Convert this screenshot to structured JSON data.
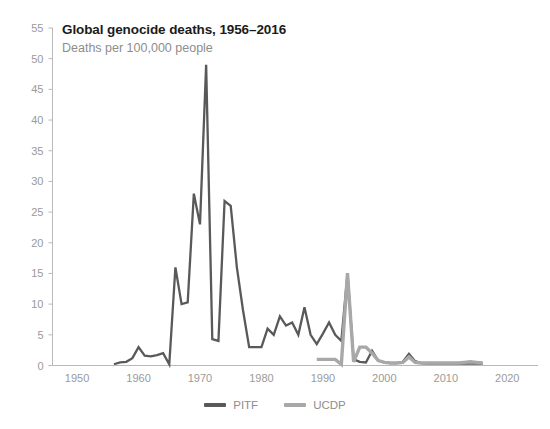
{
  "chart_data": {
    "type": "line",
    "title": "Global genocide deaths, 1956–2016",
    "subtitle": "Deaths per 100,000 people",
    "xlabel": "",
    "ylabel": "",
    "xlim": [
      1946,
      2025
    ],
    "ylim": [
      0,
      55
    ],
    "grid": false,
    "legend_position": "bottom-center",
    "xticks": [
      1950,
      1960,
      1970,
      1980,
      1990,
      2000,
      2010,
      2020
    ],
    "xtick_labels": [
      "1950",
      "1960",
      "1970",
      "1980",
      "1990",
      "2000",
      "2010",
      "2020"
    ],
    "yticks": [
      0,
      5,
      10,
      15,
      20,
      25,
      30,
      35,
      40,
      45,
      50,
      55
    ],
    "ytick_labels": [
      "0",
      "5",
      "10",
      "15",
      "20",
      "25",
      "30",
      "35",
      "40",
      "45",
      "50",
      "55"
    ],
    "colors": {
      "PITF": "#595959",
      "UCDP": "#a8a8a8"
    },
    "series": [
      {
        "name": "PITF",
        "color": "#595959",
        "x": [
          1956,
          1957,
          1958,
          1959,
          1960,
          1961,
          1962,
          1963,
          1964,
          1965,
          1966,
          1967,
          1968,
          1969,
          1970,
          1971,
          1972,
          1973,
          1974,
          1975,
          1976,
          1977,
          1978,
          1979,
          1980,
          1981,
          1982,
          1983,
          1984,
          1985,
          1986,
          1987,
          1988,
          1989,
          1990,
          1991,
          1992,
          1993,
          1994,
          1995,
          1996,
          1997,
          1998,
          1999,
          2000,
          2001,
          2002,
          2003,
          2004,
          2005,
          2006,
          2007,
          2008,
          2009,
          2010,
          2011,
          2012,
          2013,
          2014,
          2015,
          2016
        ],
        "values": [
          0.2,
          0.5,
          0.6,
          1.2,
          3.0,
          1.6,
          1.5,
          1.7,
          2.0,
          0.2,
          16.0,
          10.0,
          10.3,
          28.0,
          23.0,
          49.0,
          4.3,
          4.0,
          26.8,
          26.0,
          16.0,
          9.0,
          3.0,
          3.0,
          3.0,
          6.0,
          5.0,
          8.0,
          6.5,
          7.0,
          5.0,
          9.5,
          5.0,
          3.5,
          5.2,
          7.0,
          5.0,
          4.0,
          15.0,
          1.0,
          0.6,
          0.5,
          2.4,
          0.8,
          0.5,
          0.4,
          0.4,
          0.6,
          1.9,
          0.7,
          0.4,
          0.3,
          0.3,
          0.3,
          0.3,
          0.3,
          0.3,
          0.3,
          0.3,
          0.3,
          0.3
        ]
      },
      {
        "name": "UCDP",
        "color": "#a8a8a8",
        "x": [
          1989,
          1990,
          1991,
          1992,
          1993,
          1994,
          1995,
          1996,
          1997,
          1998,
          1999,
          2000,
          2001,
          2002,
          2003,
          2004,
          2005,
          2006,
          2007,
          2008,
          2009,
          2010,
          2011,
          2012,
          2013,
          2014,
          2015,
          2016
        ],
        "values": [
          1.0,
          1.0,
          1.0,
          1.0,
          0.2,
          15.0,
          0.6,
          3.0,
          3.0,
          2.0,
          0.8,
          0.5,
          0.4,
          0.4,
          0.5,
          1.4,
          0.5,
          0.4,
          0.4,
          0.4,
          0.4,
          0.4,
          0.4,
          0.4,
          0.5,
          0.6,
          0.5,
          0.4
        ]
      }
    ]
  },
  "legend": {
    "items": [
      {
        "label": "PITF",
        "color": "#595959"
      },
      {
        "label": "UCDP",
        "color": "#a8a8a8"
      }
    ]
  }
}
